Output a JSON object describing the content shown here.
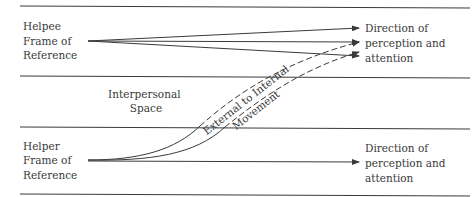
{
  "diagram": {
    "helpee_label": [
      "Helpee",
      "Frame of",
      "Reference"
    ],
    "helper_label": [
      "Helper",
      "Frame of",
      "Reference"
    ],
    "interpersonal_label": [
      "Interpersonal",
      "Space"
    ],
    "movement_label": [
      "External to Internal",
      "Movement"
    ],
    "top_direction_label": [
      "Direction of",
      "perception and",
      "attention"
    ],
    "bottom_direction_label": [
      "Direction of",
      "perception and",
      "attention"
    ]
  }
}
